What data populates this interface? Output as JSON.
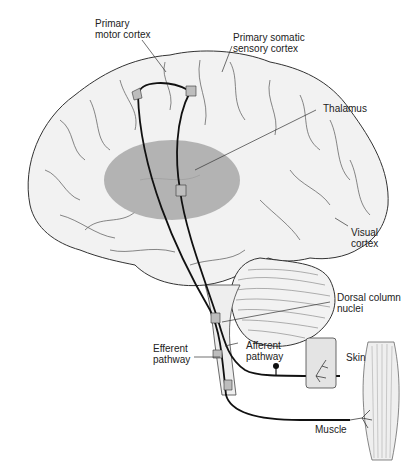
{
  "diagram": {
    "colors": {
      "brain_fill": "#f2f2f2",
      "outline": "#333333",
      "thalamus_fill": "#a8a8a8",
      "pathway": "#111111",
      "synapse_fill": "#bdbdbd"
    },
    "labels": {
      "primary_motor_cortex_line1": "Primary",
      "primary_motor_cortex_line2": "motor cortex",
      "primary_somatic_line1": "Primary somatic",
      "primary_somatic_line2": "sensory cortex",
      "thalamus": "Thalamus",
      "visual_cortex_line1": "Visual",
      "visual_cortex_line2": "cortex",
      "dorsal_column_line1": "Dorsal column",
      "dorsal_column_line2": "nuclei",
      "afferent_line1": "Afferent",
      "afferent_line2": "pathway",
      "efferent_line1": "Efferent",
      "efferent_line2": "pathway",
      "skin": "Skin",
      "muscle": "Muscle"
    }
  }
}
